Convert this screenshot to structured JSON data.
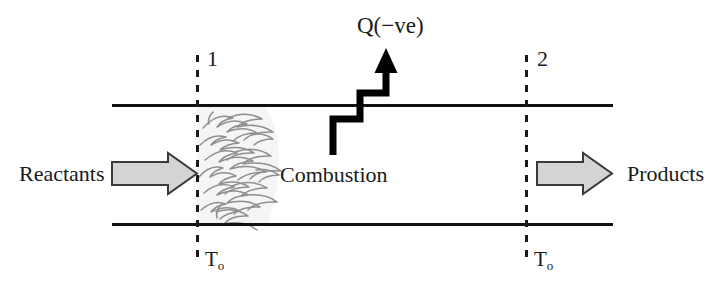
{
  "diagram": {
    "colors": {
      "background": "#ffffff",
      "duct_line": "#111111",
      "station_dash": "#1a1a1a",
      "heat_arrow": "#000000",
      "flow_arrow_fill": "#d4d4d4",
      "flow_arrow_stroke": "#3a3a3a",
      "flame_stroke": "#8a8a8a",
      "flame_fill": "#f2f2f2",
      "text": "#1a1a1a"
    },
    "stations": [
      {
        "id": "inlet",
        "label": "1",
        "temperature_label": "T",
        "temperature_subscript": "o"
      },
      {
        "id": "outlet",
        "label": "2",
        "temperature_label": "T",
        "temperature_subscript": "o"
      }
    ],
    "flows": [
      {
        "id": "inlet-stream",
        "label": "Reactants",
        "direction": "right"
      },
      {
        "id": "outlet-stream",
        "label": "Products",
        "direction": "right"
      }
    ],
    "heat": {
      "label": "Q(−ve)",
      "direction": "out",
      "icon": "zigzag-up-arrow"
    },
    "zone": {
      "label": "Combustion",
      "icon": "flame-cluster"
    }
  }
}
